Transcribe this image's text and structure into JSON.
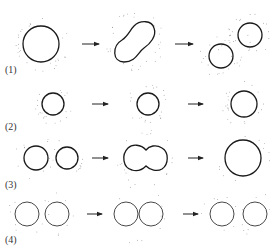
{
  "figure": {
    "rows": [
      {
        "label": "(1)",
        "stages": [
          "single large circle",
          "elongated peanut shape",
          "two separate circles"
        ]
      },
      {
        "label": "(2)",
        "stages": [
          "small circle",
          "small circle",
          "slightly larger circle"
        ]
      },
      {
        "label": "(3)",
        "stages": [
          "two adjacent circles",
          "fused peanut shape",
          "single large circle"
        ]
      },
      {
        "label": "(4)",
        "stages": [
          "two touching circles",
          "two overlapping circles",
          "two separated circles"
        ]
      }
    ],
    "colors": {
      "stroke": "#1a1a1a",
      "dots": "#777777",
      "background": "#ffffff"
    }
  }
}
